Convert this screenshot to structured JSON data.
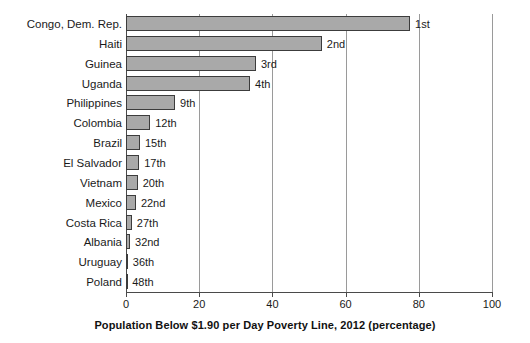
{
  "chart_data": {
    "type": "bar",
    "orientation": "horizontal",
    "title": "",
    "xlabel": "Population Below $1.90 per Day Poverty Line, 2012 (percentage)",
    "ylabel": "",
    "xlim": [
      0,
      100
    ],
    "xticks": [
      "0",
      "20",
      "40",
      "60",
      "80",
      "100"
    ],
    "grid": true,
    "legend": "none",
    "bar_color": "#a9a9a9",
    "bar_border_color": "#3c3c3c",
    "categories": [
      "Congo, Dem. Rep.",
      "Haiti",
      "Guinea",
      "Uganda",
      "Philippines",
      "Colombia",
      "Brazil",
      "El Salvador",
      "Vietnam",
      "Mexico",
      "Costa Rica",
      "Albania",
      "Uruguay",
      "Poland"
    ],
    "values": [
      77.6,
      53.5,
      35.5,
      33.9,
      13.4,
      6.6,
      3.8,
      3.6,
      3.2,
      2.7,
      1.6,
      1.1,
      0.5,
      0.1
    ],
    "annotations": [
      "1st",
      "2nd",
      "3rd",
      "4th",
      "9th",
      "12th",
      "15th",
      "17th",
      "20th",
      "22nd",
      "27th",
      "32nd",
      "36th",
      "48th"
    ]
  }
}
